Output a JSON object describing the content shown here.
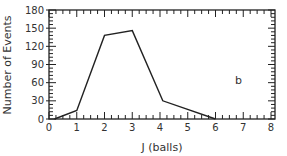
{
  "chart_data": {
    "type": "line",
    "title": "",
    "xlabel": "J  (balls)",
    "ylabel": "Number of Events",
    "xlim": [
      0,
      8
    ],
    "ylim": [
      0,
      180
    ],
    "x_ticks": [
      0,
      1,
      2,
      3,
      4,
      5,
      6,
      7,
      8
    ],
    "y_ticks": [
      0,
      30,
      60,
      90,
      120,
      150,
      180
    ],
    "grid": false,
    "legend": null,
    "annotations": [
      {
        "text": "b",
        "x": 6.7,
        "y": 65
      }
    ],
    "series": [
      {
        "name": "events",
        "x": [
          0.2,
          1,
          2,
          3,
          4.1,
          6
        ],
        "y": [
          0,
          14,
          138,
          146,
          30,
          0
        ]
      }
    ]
  },
  "colors": {
    "line": "#222222",
    "axis": "#222222",
    "text": "#333333"
  }
}
